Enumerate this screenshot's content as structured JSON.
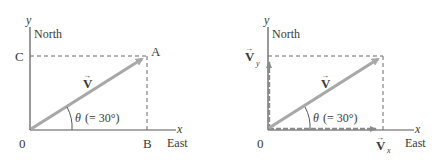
{
  "diagram": {
    "colors": {
      "axis": "#555555",
      "vector": "#a8a8a8",
      "dashed": "#6a6a6a",
      "component": "#8a8a8a",
      "text": "#3a3a3a"
    },
    "left_panel": {
      "y_axis_label": "y",
      "north_label": "North",
      "x_axis_label": "x",
      "east_label": "East",
      "origin_label": "0",
      "point_c": "C",
      "point_a": "A",
      "point_b": "B",
      "vector_label": "V",
      "vector_arrow": "→",
      "angle_symbol": "θ",
      "angle_text": "(= 30°)"
    },
    "right_panel": {
      "y_axis_label": "y",
      "north_label": "North",
      "x_axis_label": "x",
      "east_label": "East",
      "origin_label": "0",
      "vector_label": "V",
      "vector_arrow": "→",
      "vy_label": "V",
      "vy_sub": "y",
      "vx_label": "V",
      "vx_sub": "x",
      "angle_symbol": "θ",
      "angle_text": "(= 30°)"
    }
  }
}
